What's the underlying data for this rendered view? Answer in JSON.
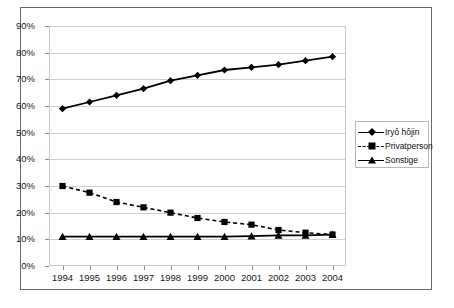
{
  "chart_data": {
    "type": "line",
    "title": "",
    "xlabel": "",
    "ylabel": "",
    "categories": [
      "1994",
      "1995",
      "1996",
      "1997",
      "1998",
      "1999",
      "2000",
      "2001",
      "2002",
      "2003",
      "2004"
    ],
    "x": [
      1994,
      1995,
      1996,
      1997,
      1998,
      1999,
      2000,
      2001,
      2002,
      2003,
      2004
    ],
    "ylim": [
      0,
      90
    ],
    "ytick_values": [
      0,
      10,
      20,
      30,
      40,
      50,
      60,
      70,
      80,
      90
    ],
    "ytick_labels": [
      "0%",
      "10%",
      "20%",
      "30%",
      "40%",
      "50%",
      "60%",
      "70%",
      "80%",
      "90%"
    ],
    "grid": true,
    "legend_position": "right",
    "series": [
      {
        "name": "Iryô hôjin",
        "marker": "diamond",
        "linestyle": "solid",
        "color": "#000000",
        "values": [
          59.0,
          61.5,
          64.0,
          66.5,
          69.5,
          71.5,
          73.5,
          74.5,
          75.5,
          77.0,
          78.5
        ]
      },
      {
        "name": "Privatperson",
        "marker": "square",
        "linestyle": "dashed",
        "color": "#000000",
        "values": [
          30.0,
          27.5,
          24.0,
          22.0,
          20.0,
          18.0,
          16.5,
          15.5,
          13.5,
          12.5,
          11.8
        ]
      },
      {
        "name": "Sonstige",
        "marker": "triangle",
        "linestyle": "solid",
        "color": "#000000",
        "values": [
          11.0,
          11.0,
          11.0,
          11.0,
          11.0,
          11.0,
          11.0,
          11.2,
          11.5,
          11.5,
          11.8
        ]
      }
    ]
  },
  "legend": {
    "entries": [
      {
        "label": "Iryô hôjin"
      },
      {
        "label": "Privatperson"
      },
      {
        "label": "Sonstige"
      }
    ]
  },
  "colors": {
    "series": "#000000",
    "gridline": "#d0d0d0",
    "plot_border": "#c9c9c9",
    "outer_border": "#6b6b6b",
    "background": "#ffffff",
    "text": "#1a1a1a"
  }
}
